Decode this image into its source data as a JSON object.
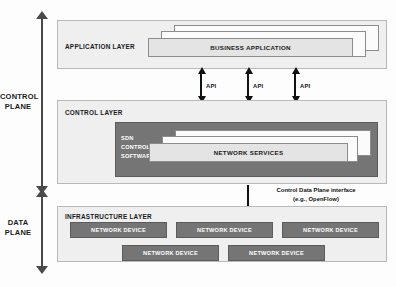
{
  "diagram": {
    "colors": {
      "panel_fill": "#efefef",
      "panel_border": "#b9b9b9",
      "dark_fill": "#757575",
      "light_box": "#e4e4e4",
      "arrow": "#111111",
      "rail": "#4a4a4a",
      "text": "#1a1a1a",
      "inverse_text": "#ffffff"
    }
  },
  "planes": [
    {
      "label_line1": "CONTROL",
      "label_line2": "PLANE"
    },
    {
      "label_line1": "DATA",
      "label_line2": "PLANE"
    }
  ],
  "layers": {
    "application": {
      "title": "APPLICATION LAYER",
      "stack": {
        "front_label": "BUSINESS APPLICATION",
        "count": 3
      }
    },
    "control": {
      "title": "CONTROL LAYER",
      "sdn_software": {
        "line1": "SDN",
        "line2": "CONTROL",
        "line3": "SOFTWARE"
      },
      "stack": {
        "front_label": "NETWORK SERVICES",
        "count": 3
      }
    },
    "infrastructure": {
      "title": "INFRASTRUCTURE LAYER",
      "devices": [
        {
          "label": "NETWORK DEVICE"
        },
        {
          "label": "NETWORK DEVICE"
        },
        {
          "label": "NETWORK DEVICE"
        },
        {
          "label": "NETWORK DEVICE"
        },
        {
          "label": "NETWORK DEVICE"
        }
      ]
    }
  },
  "interfaces": {
    "api_arrows": [
      {
        "label": "API"
      },
      {
        "label": "API"
      },
      {
        "label": "API"
      }
    ],
    "control_data_plane": {
      "line1": "Control Data Plane interface",
      "line2": "(e.g., OpenFlow)"
    }
  }
}
